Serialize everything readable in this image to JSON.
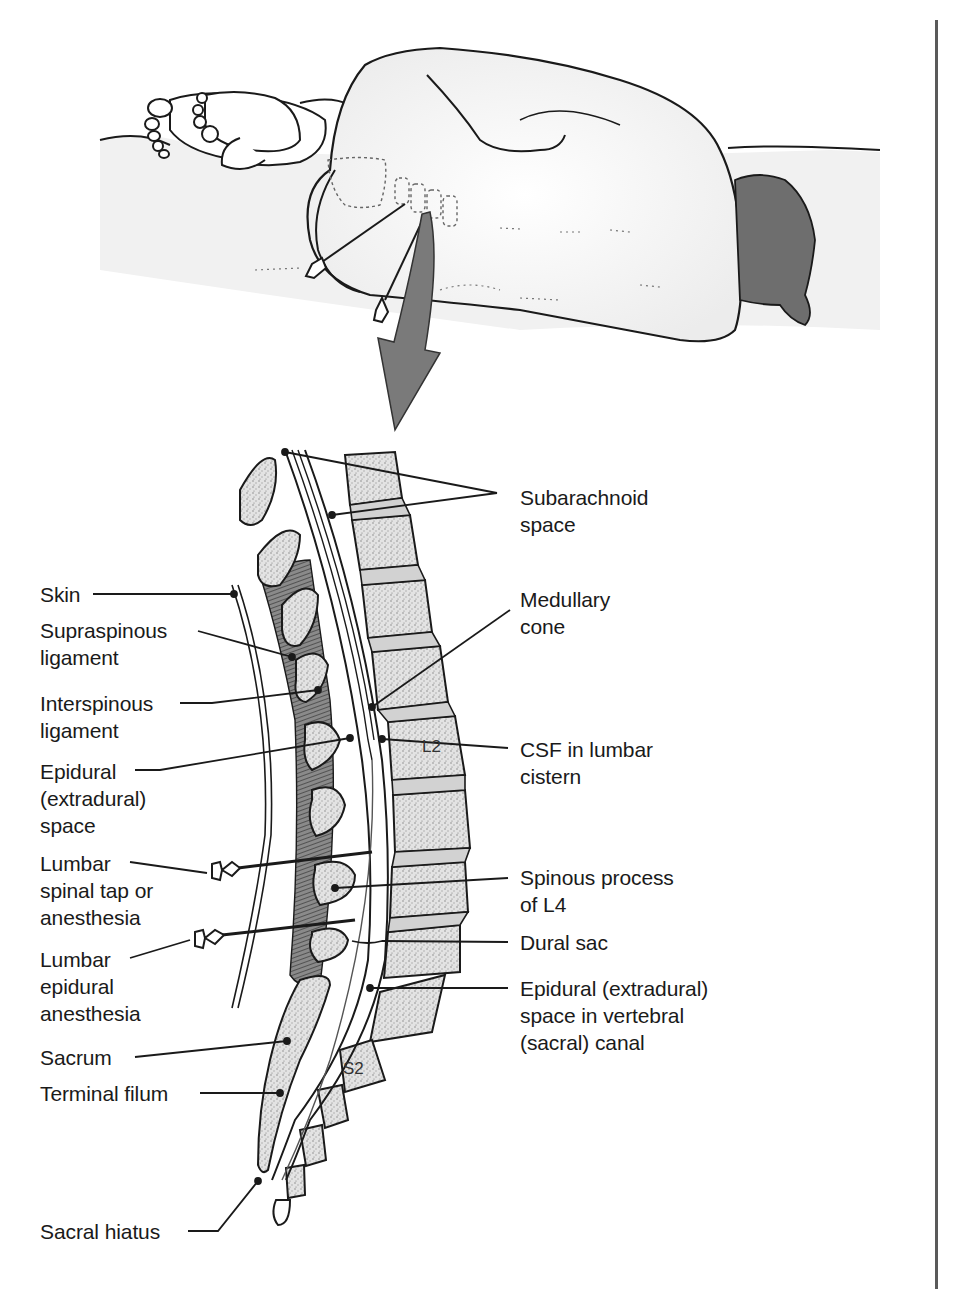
{
  "figure": {
    "top_panel": "Patient lying on side (lateral decubitus) with knees flexed; two needles inserted into lumbar region; large arrow pointing down to sagittal section",
    "bottom_panel": "Sagittal section of lower vertebral column showing lumbar puncture and epidural anesthesia"
  },
  "vertebra_labels": {
    "l2": "L2",
    "s2": "S2"
  },
  "labels_left": [
    {
      "id": "skin",
      "text": "Skin"
    },
    {
      "id": "supraspinous",
      "text": "Supraspinous\nligament"
    },
    {
      "id": "interspinous",
      "text": "Interspinous\nligament"
    },
    {
      "id": "epidural",
      "text": "Epidural\n(extradural)\nspace"
    },
    {
      "id": "lumbar-tap",
      "text": "Lumbar\nspinal tap or\nanesthesia"
    },
    {
      "id": "lumbar-epidural",
      "text": "Lumbar\nepidural\nanesthesia"
    },
    {
      "id": "sacrum",
      "text": "Sacrum"
    },
    {
      "id": "terminal-filum",
      "text": "Terminal filum"
    },
    {
      "id": "sacral-hiatus",
      "text": "Sacral hiatus"
    }
  ],
  "labels_right": [
    {
      "id": "subarachnoid",
      "text": "Subarachnoid\nspace"
    },
    {
      "id": "medullary-cone",
      "text": "Medullary\ncone"
    },
    {
      "id": "csf",
      "text": "CSF in lumbar\ncistern"
    },
    {
      "id": "spinous-l4",
      "text": "Spinous process\nof L4"
    },
    {
      "id": "dural-sac",
      "text": "Dural sac"
    },
    {
      "id": "epidural-sacral",
      "text": "Epidural (extradural)\nspace in vertebral\n(sacral) canal"
    }
  ],
  "colors": {
    "line": "#1a1a1a",
    "bone_fill": "#e6e6e6",
    "bone_speckle": "#9a9a9a",
    "disc_fill": "#d2d2d2",
    "ligament": "#555555",
    "hair": "#6a6a6a",
    "arrow": "#7a7a7a",
    "surface": "#f2f2f2"
  }
}
